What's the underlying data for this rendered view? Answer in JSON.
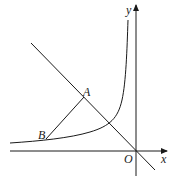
{
  "diagram": {
    "type": "coordinate-geometry",
    "labels": {
      "x_axis": "x",
      "y_axis": "y",
      "origin": "O",
      "point_a": "A",
      "point_b": "B"
    },
    "colors": {
      "stroke": "#1a1a1a",
      "background": "#ffffff"
    }
  }
}
